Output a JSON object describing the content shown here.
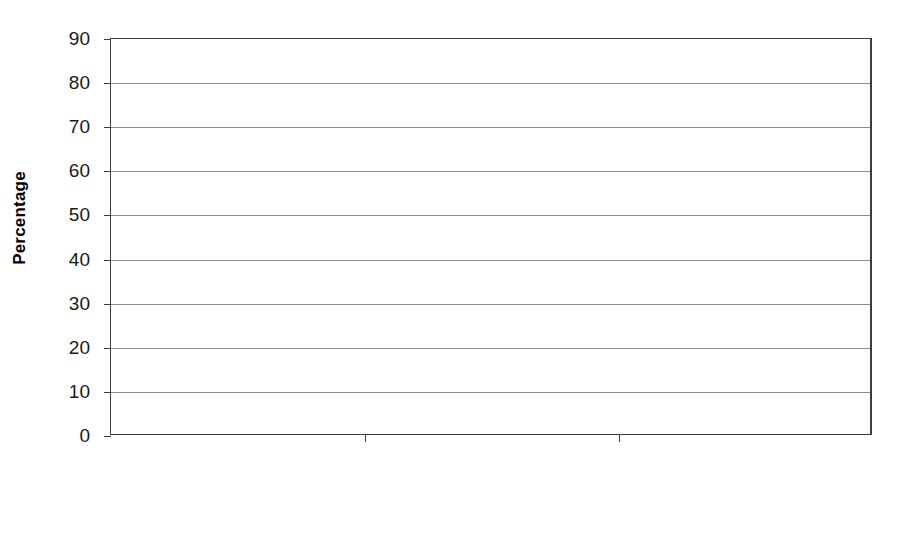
{
  "chart_data": {
    "type": "bar",
    "subtype": "stacked-grouped-bar",
    "title": "",
    "xlabel": "",
    "ylabel": "Percentage",
    "ylim": [
      0,
      90
    ],
    "yticks": [
      0,
      10,
      20,
      30,
      40,
      50,
      60,
      70,
      80,
      90
    ],
    "ytick_labels": [
      "0",
      "10",
      "20",
      "30",
      "40",
      "50",
      "60",
      "70",
      "80",
      "90"
    ],
    "grid": "horizontal",
    "legend_position": "bottom",
    "categories": [
      "Increase access",
      "Decrease cost",
      "Decrease quality"
    ],
    "bars_per_category": [
      "Agree bar",
      "Disagree bar"
    ],
    "series": [
      {
        "name": "Strongly disagree",
        "color": "#ffffff",
        "bar": "Disagree bar",
        "values": [
          21.0,
          37.5,
          6.0
        ]
      },
      {
        "name": "Somewhat disagree",
        "color": "#d4d4d4",
        "bar": "Disagree bar",
        "values": [
          25.0,
          32.5,
          15.5
        ]
      },
      {
        "name": "Somewhat agree",
        "color": "#3b3b3b",
        "bar": "Agree bar",
        "values": [
          50.0,
          28.0,
          26.0
        ]
      },
      {
        "name": "Strongly agree",
        "color": "#000000",
        "bar": "Agree bar",
        "values": [
          3.5,
          1.5,
          51.0
        ]
      }
    ],
    "bar_totals": {
      "agree": [
        53.5,
        29.5,
        77.0
      ],
      "disagree": [
        46.0,
        70.0,
        21.5
      ]
    },
    "annotations": []
  },
  "axis": {
    "y_title": "Percentage",
    "ticks": [
      {
        "label": "90",
        "value": 90
      },
      {
        "label": "80",
        "value": 80
      },
      {
        "label": "70",
        "value": 70
      },
      {
        "label": "60",
        "value": 60
      },
      {
        "label": "50",
        "value": 50
      },
      {
        "label": "40",
        "value": 40
      },
      {
        "label": "30",
        "value": 30
      },
      {
        "label": "20",
        "value": 20
      },
      {
        "label": "10",
        "value": 10
      },
      {
        "label": "0",
        "value": 0
      }
    ]
  },
  "categories": [
    {
      "label": "Increase access"
    },
    {
      "label": "Decrease cost"
    },
    {
      "label": "Decrease quality"
    }
  ],
  "legend": {
    "items": [
      {
        "label": "Strongly disagree",
        "swatch_class": "sw-strongly-disagree",
        "color": "#ffffff"
      },
      {
        "label": "Somewhat disagree",
        "swatch_class": "sw-somewhat-disagree",
        "color": "#d4d4d4"
      },
      {
        "label": "Somewhat agree",
        "swatch_class": "sw-somewhat-agree",
        "color": "#3b3b3b"
      },
      {
        "label": "Strongly agree",
        "swatch_class": "sw-strongly-agree",
        "color": "#000000"
      }
    ]
  }
}
